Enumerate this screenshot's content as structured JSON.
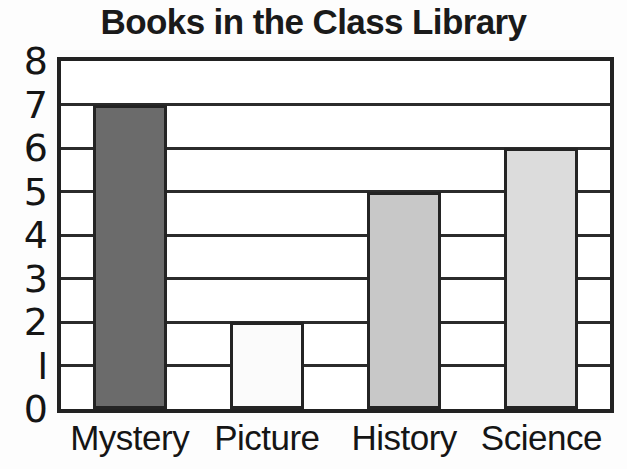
{
  "chart_data": {
    "type": "bar",
    "title": "Books in the Class Library",
    "xlabel": "",
    "ylabel": "",
    "categories": [
      "Mystery",
      "Picture",
      "History",
      "Science"
    ],
    "values": [
      7,
      2,
      5,
      6
    ],
    "ylim": [
      0,
      8
    ],
    "y_ticks": [
      "0",
      "1",
      "2",
      "3",
      "4",
      "5",
      "6",
      "7",
      "8"
    ],
    "y_tick_display": [
      "0",
      "I",
      "2",
      "3",
      "4",
      "5",
      "6",
      "7",
      "8"
    ],
    "grid": true,
    "legend": "none",
    "bar_colors": [
      "#6b6b6b",
      "#fbfbfb",
      "#c8c8c8",
      "#dcdcdc"
    ],
    "bar_border_color": "#242424",
    "axis_color": "#222222",
    "background_color": "#fdfdfd",
    "text_color": "#151515"
  }
}
